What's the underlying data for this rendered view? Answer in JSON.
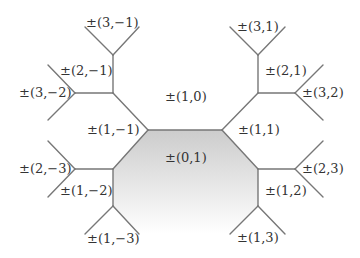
{
  "diagram": {
    "type": "tree-tessellation",
    "colors": {
      "edge": "#777777",
      "shade_top": "#cfcfcf",
      "shade_bottom": "#ffffff",
      "text": "#333333"
    },
    "labels": {
      "top_left_3_m1": "±(3,−1)",
      "left_2_m1": "±(2,−1)",
      "left_3_m2": "±(3,−2)",
      "center_1_0": "±(1,0)",
      "left_1_m1": "±(1,−1)",
      "top_right_3_1": "±(3,1)",
      "right_2_1": "±(2,1)",
      "right_3_2": "±(3,2)",
      "right_1_1": "±(1,1)",
      "center_0_1": "±(0,1)",
      "left_2_m3": "±(2,−3)",
      "left_1_m2": "±(1,−2)",
      "bottom_1_m3": "±(1,−3)",
      "right_2_3": "±(2,3)",
      "right_1_2": "±(1,2)",
      "bottom_1_3": "±(1,3)"
    }
  }
}
